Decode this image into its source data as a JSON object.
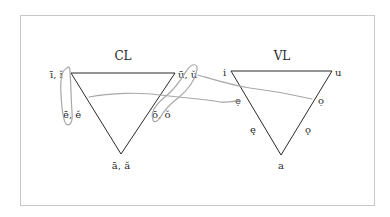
{
  "figure": {
    "panels": [
      {
        "id": "cl",
        "title": "CL",
        "labels": {
          "top_left": "ī, ĭ",
          "top_right": "ū, ŭ",
          "mid_left": "ē, ĕ",
          "mid_right": "ō, ŏ",
          "bottom": "ā, ă"
        }
      },
      {
        "id": "vl",
        "title": "VL",
        "labels": {
          "top_left": "i",
          "top_right": "u",
          "upper_left": "ẹ",
          "upper_right": "ọ",
          "lower_left": "ę",
          "lower_right": "ǫ",
          "bottom": "a"
        }
      }
    ],
    "colors": {
      "line": "#2a2a2a",
      "annotation": "#a8a8a8",
      "frame": "#c8c8c8"
    }
  }
}
